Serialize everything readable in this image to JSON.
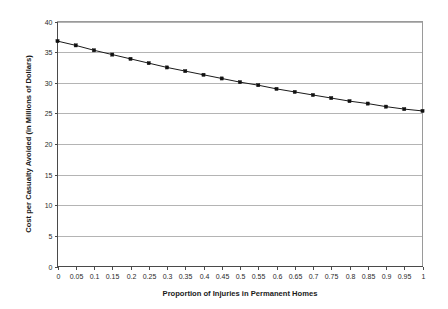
{
  "chart_data": {
    "type": "line",
    "title": "",
    "xlabel": "Proportion of Injuries in Permanent Homes",
    "ylabel": "Cost per Casualty Avoided (in Millions of Dollars)",
    "xlim": [
      0,
      1
    ],
    "ylim": [
      0,
      40
    ],
    "grid": true,
    "grid_axis": "y",
    "legend": false,
    "legend_position": "none",
    "marker": "square",
    "line_color": "#1a1a1a",
    "marker_color": "#111111",
    "gridline_color": "#b4b4b4",
    "xticks": [
      "0",
      "0.05",
      "0.1",
      "0.15",
      "0.2",
      "0.25",
      "0.3",
      "0.35",
      "0.4",
      "0.45",
      "0.5",
      "0.55",
      "0.6",
      "0.65",
      "0.7",
      "0.75",
      "0.8",
      "0.85",
      "0.9",
      "0.95",
      "1"
    ],
    "yticks": [
      "0",
      "5",
      "10",
      "15",
      "20",
      "25",
      "30",
      "35",
      "40"
    ],
    "x": [
      0,
      0.05,
      0.1,
      0.15,
      0.2,
      0.25,
      0.3,
      0.35,
      0.4,
      0.45,
      0.5,
      0.55,
      0.6,
      0.65,
      0.7,
      0.75,
      0.8,
      0.85,
      0.9,
      0.95,
      1
    ],
    "values": [
      36.8,
      36.1,
      35.3,
      34.6,
      33.9,
      33.2,
      32.5,
      31.9,
      31.3,
      30.7,
      30.1,
      29.6,
      29.0,
      28.5,
      28.0,
      27.5,
      27.0,
      26.6,
      26.1,
      25.7,
      25.4
    ],
    "series": [
      {
        "name": "Cost per Casualty Avoided",
        "values": [
          36.8,
          36.1,
          35.3,
          34.6,
          33.9,
          33.2,
          32.5,
          31.9,
          31.3,
          30.7,
          30.1,
          29.6,
          29.0,
          28.5,
          28.0,
          27.5,
          27.0,
          26.6,
          26.1,
          25.7,
          25.4
        ]
      }
    ]
  }
}
